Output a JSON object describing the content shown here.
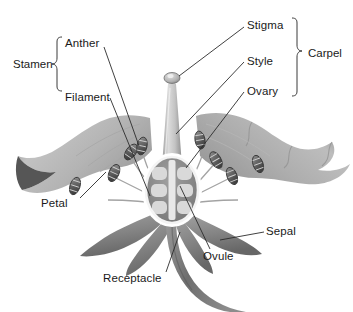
{
  "diagram": {
    "background_color": "#ffffff",
    "label_color": "#1a1a1a",
    "leader_line_color": "#2b2b2b",
    "bracket_color": "#3a3a3a"
  },
  "labels": {
    "stigma": "Stigma",
    "style": "Style",
    "ovary": "Ovary",
    "carpel": "Carpel",
    "anther": "Anther",
    "filament": "Filament",
    "stamen": "Stamen",
    "petal": "Petal",
    "sepal": "Sepal",
    "ovule": "Ovule",
    "receptacle": "Receptacle"
  },
  "groups": {
    "stamen": {
      "label": "Stamen",
      "members": [
        "Anther",
        "Filament"
      ],
      "bracket_side": "right-facing"
    },
    "carpel": {
      "label": "Carpel",
      "members": [
        "Stigma",
        "Style",
        "Ovary"
      ],
      "bracket_side": "left-facing"
    }
  },
  "parts": {
    "petals": {
      "name": "Petal",
      "count": 2,
      "fill": "#b9b9b9",
      "tip_fill": "#4f4f4f",
      "description": "large light gray ruffled petals spreading left and right"
    },
    "sepals": {
      "name": "Sepal",
      "count": 4,
      "fill": "#8d8d8d",
      "description": "darker gray narrow leaf-like structures below the petals"
    },
    "stamens": {
      "name": "Stamen",
      "count": 8,
      "anther_fill": "#6f6f6f",
      "filament_fill": "#9a9a9a",
      "description": "slender filaments topped with ribbed capsule-shaped anthers"
    },
    "pistil": {
      "stigma": {
        "name": "Stigma",
        "fill": "#c9c9c9",
        "description": "knob at the top of the style"
      },
      "style": {
        "name": "Style",
        "fill": "#cfcfcf",
        "description": "tapering column rising from the ovary"
      },
      "ovary": {
        "name": "Ovary",
        "outline": "#ffffff",
        "fill": "#8a8a8a",
        "description": "white-outlined oval chamber at the flower center"
      },
      "ovules": {
        "name": "Ovule",
        "count": 6,
        "fill": "#d6d6d6",
        "arrangement": "three rows of two, flanking a central partition"
      }
    },
    "receptacle": {
      "name": "Receptacle",
      "fill": "#7d7d7d",
      "description": "thick curved stalk beneath the flower"
    }
  },
  "label_positions": [
    {
      "id": "stigma",
      "x": 247,
      "y": 20
    },
    {
      "id": "style",
      "x": 247,
      "y": 56
    },
    {
      "id": "ovary",
      "x": 247,
      "y": 86
    },
    {
      "id": "carpel",
      "x": 308,
      "y": 51
    },
    {
      "id": "anther",
      "x": 64,
      "y": 39
    },
    {
      "id": "filament",
      "x": 64,
      "y": 91
    },
    {
      "id": "stamen",
      "x": 14,
      "y": 65
    },
    {
      "id": "petal",
      "x": 42,
      "y": 199
    },
    {
      "id": "sepal",
      "x": 266,
      "y": 226
    },
    {
      "id": "ovule",
      "x": 204,
      "y": 252
    },
    {
      "id": "receptacle",
      "x": 104,
      "y": 274
    }
  ]
}
